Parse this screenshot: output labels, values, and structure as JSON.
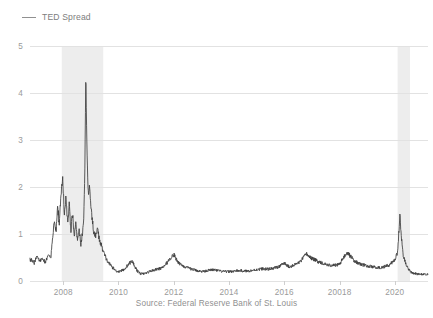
{
  "legend": {
    "swatch_name": "line-swatch",
    "label": "TED Spread",
    "color": "#909090"
  },
  "axis": {
    "ylabel": "Percent",
    "yticks": [
      "0",
      "1",
      "2",
      "3",
      "4",
      "5"
    ],
    "xticks": [
      "2008",
      "2010",
      "2012",
      "2014",
      "2016",
      "20018",
      "2020"
    ]
  },
  "source": "Source: Federal Reserve Bank of St. Louis",
  "colors": {
    "line": "#3d3d3d",
    "grid": "#e2e2e2",
    "recession_band": "#ededed",
    "tick_label": "#9a9a9a",
    "background": "#ffffff"
  },
  "chart_data": {
    "type": "line",
    "title": "",
    "xlabel": "",
    "ylabel": "Percent",
    "xlim": [
      2006.8,
      2021.2
    ],
    "ylim": [
      0,
      5
    ],
    "grid": true,
    "legend_position": "top-left",
    "xticks": [
      2008,
      2010,
      2012,
      2014,
      2016,
      2018,
      2020
    ],
    "xtick_labels": [
      "2008",
      "2010",
      "2012",
      "2014",
      "2016",
      "20018",
      "2020"
    ],
    "yticks": [
      0,
      1,
      2,
      3,
      4,
      5
    ],
    "annotations": [
      {
        "type": "shaded_band",
        "label": "Great Recession",
        "x_start": 2007.95,
        "x_end": 2009.45
      },
      {
        "type": "shaded_band",
        "label": "COVID-19 Recession",
        "x_start": 2020.1,
        "x_end": 2020.55
      }
    ],
    "series": [
      {
        "name": "TED Spread",
        "color": "#3d3d3d",
        "x": [
          2006.85,
          2006.95,
          2007.05,
          2007.15,
          2007.25,
          2007.35,
          2007.45,
          2007.55,
          2007.62,
          2007.68,
          2007.74,
          2007.8,
          2007.86,
          2007.92,
          2007.98,
          2008.04,
          2008.1,
          2008.16,
          2008.22,
          2008.28,
          2008.34,
          2008.4,
          2008.46,
          2008.52,
          2008.58,
          2008.64,
          2008.7,
          2008.74,
          2008.78,
          2008.8,
          2008.82,
          2008.85,
          2008.88,
          2008.92,
          2008.96,
          2009.0,
          2009.06,
          2009.12,
          2009.18,
          2009.24,
          2009.3,
          2009.4,
          2009.5,
          2009.6,
          2009.7,
          2009.8,
          2009.9,
          2010.0,
          2010.2,
          2010.4,
          2010.5,
          2010.6,
          2010.7,
          2010.8,
          2010.9,
          2011.0,
          2011.2,
          2011.4,
          2011.6,
          2011.8,
          2011.9,
          2012.0,
          2012.05,
          2012.1,
          2012.2,
          2012.4,
          2012.6,
          2012.8,
          2013.0,
          2013.2,
          2013.4,
          2013.6,
          2013.8,
          2014.0,
          2014.2,
          2014.4,
          2014.6,
          2014.8,
          2015.0,
          2015.2,
          2015.4,
          2015.6,
          2015.8,
          2015.9,
          2016.0,
          2016.1,
          2016.2,
          2016.4,
          2016.6,
          2016.7,
          2016.8,
          2016.9,
          2017.0,
          2017.2,
          2017.4,
          2017.6,
          2017.8,
          2018.0,
          2018.1,
          2018.2,
          2018.3,
          2018.4,
          2018.5,
          2018.6,
          2018.8,
          2019.0,
          2019.2,
          2019.4,
          2019.6,
          2019.8,
          2020.0,
          2020.1,
          2020.18,
          2020.24,
          2020.3,
          2020.4,
          2020.5,
          2020.6,
          2020.8,
          2021.0,
          2021.15
        ],
        "y": [
          0.45,
          0.38,
          0.52,
          0.42,
          0.48,
          0.4,
          0.55,
          0.48,
          0.9,
          1.35,
          1.05,
          1.6,
          1.2,
          1.85,
          2.2,
          1.45,
          1.75,
          1.3,
          1.6,
          1.1,
          1.45,
          0.95,
          1.25,
          0.85,
          1.1,
          0.78,
          1.05,
          1.3,
          2.1,
          3.2,
          4.58,
          3.1,
          2.35,
          1.75,
          2.05,
          1.55,
          1.25,
          1.0,
          0.95,
          1.15,
          0.9,
          0.72,
          0.55,
          0.42,
          0.35,
          0.28,
          0.22,
          0.2,
          0.24,
          0.38,
          0.42,
          0.3,
          0.2,
          0.16,
          0.15,
          0.17,
          0.22,
          0.25,
          0.28,
          0.42,
          0.5,
          0.56,
          0.52,
          0.45,
          0.38,
          0.3,
          0.26,
          0.23,
          0.2,
          0.22,
          0.24,
          0.22,
          0.2,
          0.2,
          0.21,
          0.22,
          0.21,
          0.22,
          0.24,
          0.26,
          0.25,
          0.27,
          0.3,
          0.34,
          0.38,
          0.33,
          0.3,
          0.35,
          0.42,
          0.5,
          0.58,
          0.52,
          0.48,
          0.42,
          0.38,
          0.34,
          0.33,
          0.36,
          0.45,
          0.55,
          0.6,
          0.52,
          0.45,
          0.4,
          0.35,
          0.32,
          0.3,
          0.28,
          0.3,
          0.34,
          0.45,
          0.6,
          1.4,
          0.95,
          0.55,
          0.35,
          0.24,
          0.18,
          0.15,
          0.14,
          0.14
        ]
      }
    ]
  }
}
